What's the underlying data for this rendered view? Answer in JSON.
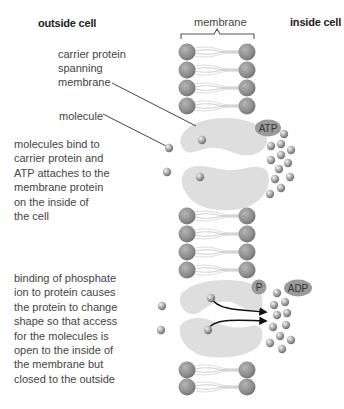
{
  "headers": {
    "outside": "outside cell",
    "membrane": "membrane",
    "inside": "inside cell"
  },
  "labels": {
    "carrier_protein": [
      "carrier protein",
      "spanning",
      "membrane"
    ],
    "molecule": "molecule"
  },
  "captions": {
    "step1": [
      "molecules bind to",
      "carrier protein and",
      "ATP attaches to the",
      "membrane protein",
      "on the inside of",
      "the cell"
    ],
    "step2": [
      "binding of phosphate",
      "ion to protein causes",
      "the protein to change",
      "shape so that access",
      "for the molecules is",
      "open to the inside of",
      "the membrane but",
      "closed to the outside"
    ]
  },
  "tags": {
    "atp": "ATP",
    "p": "P",
    "adp": "ADP"
  },
  "colors": {
    "head_group": "#8c8c8c",
    "protein": "#dcdcdc",
    "molecule": "#a8a8a8",
    "tag_fill": "#9a9a9a",
    "arrow": "#111111"
  }
}
